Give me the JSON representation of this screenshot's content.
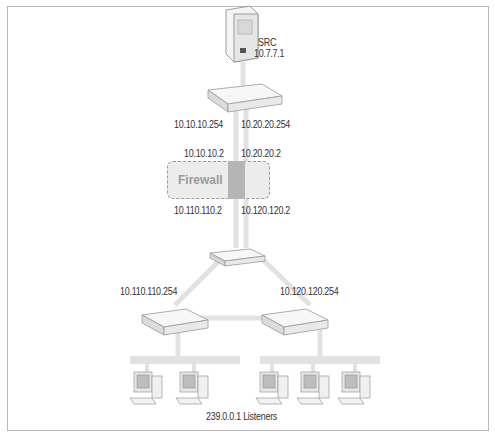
{
  "diagram": {
    "type": "network-topology",
    "source": {
      "name": "SRC",
      "ip": "10.7.7.1"
    },
    "top_router": {
      "left_ip": "10.10.10.254",
      "right_ip": "10.20.20.254"
    },
    "firewall": {
      "label": "Firewall",
      "top_left_ip": "10.10.10.2",
      "top_right_ip": "10.20.20.2",
      "bottom_left_ip": "10.110.110.2",
      "bottom_right_ip": "10.120.120.2"
    },
    "switch": {
      "name": "switch"
    },
    "left_router": {
      "ip": "10.110.110.254",
      "listeners": 2
    },
    "right_router": {
      "ip": "10.120.120.254",
      "listeners": 3
    },
    "listeners_caption": "239.0.0.1 Listeners"
  },
  "colors": {
    "link": "#e4e4e4",
    "device": "#f2f2f2",
    "device_edge": "#9a9a9a",
    "text": "#333333"
  }
}
